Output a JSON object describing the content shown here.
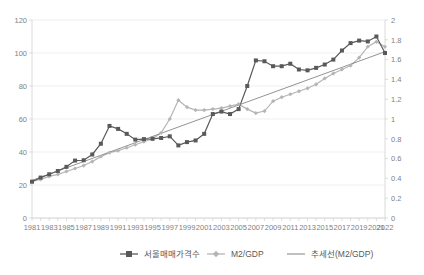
{
  "chart_data": {
    "type": "line",
    "title": "",
    "xlabel": "",
    "ylabel": "",
    "grid": true,
    "legend_position": "bottom",
    "x": [
      1981,
      1982,
      1983,
      1984,
      1985,
      1986,
      1987,
      1988,
      1989,
      1990,
      1991,
      1992,
      1993,
      1994,
      1995,
      1996,
      1997,
      1998,
      1999,
      2000,
      2001,
      2002,
      2003,
      2004,
      2005,
      2006,
      2007,
      2008,
      2009,
      2010,
      2011,
      2012,
      2013,
      2014,
      2015,
      2016,
      2017,
      2018,
      2019,
      2020,
      2021,
      2022
    ],
    "xtick_labels": [
      "1981",
      "1983",
      "1985",
      "1987",
      "1989",
      "1991",
      "1993",
      "1995",
      "1997",
      "1999",
      "2001",
      "2003",
      "2005",
      "2007",
      "2009",
      "2011",
      "2013",
      "2015",
      "2017",
      "2019",
      "2021",
      "2022"
    ],
    "axes": {
      "left": {
        "min": 0,
        "max": 120,
        "step": 20,
        "ticks": [
          "0",
          "20",
          "40",
          "60",
          "80",
          "100",
          "120"
        ]
      },
      "right": {
        "min": 0,
        "max": 2,
        "step": 0.2,
        "ticks": [
          "0",
          "0.2",
          "0.4",
          "0.6",
          "0.8",
          "1",
          "1.2",
          "1.4",
          "1.6",
          "1.8",
          "2"
        ]
      }
    },
    "series": [
      {
        "name": "서울매매가격수",
        "axis": "left",
        "color": "#595959",
        "marker": "square",
        "values": [
          22.0,
          24.5,
          26.5,
          28.5,
          31.0,
          34.8,
          35.0,
          38.5,
          45.0,
          55.8,
          54.0,
          51.0,
          47.5,
          47.8,
          48.0,
          48.5,
          49.5,
          44.0,
          46.0,
          47.0,
          51.0,
          63.0,
          64.5,
          63.0,
          66.0,
          80.0,
          95.5,
          95.0,
          92.0,
          92.0,
          93.5,
          90.0,
          89.5,
          91.0,
          93.0,
          96.0,
          101.5,
          106.0,
          107.5,
          107.0,
          110.0,
          100.0
        ]
      },
      {
        "name": "M2/GDP",
        "axis": "right",
        "color": "#b5b5b5",
        "marker": "diamond",
        "values": [
          0.37,
          0.39,
          0.42,
          0.44,
          0.47,
          0.5,
          0.53,
          0.57,
          0.62,
          0.66,
          0.68,
          0.71,
          0.74,
          0.77,
          0.8,
          0.86,
          1.0,
          1.19,
          1.12,
          1.09,
          1.09,
          1.1,
          1.11,
          1.13,
          1.15,
          1.1,
          1.06,
          1.08,
          1.18,
          1.22,
          1.25,
          1.28,
          1.31,
          1.35,
          1.41,
          1.46,
          1.5,
          1.54,
          1.62,
          1.73,
          1.78,
          1.73
        ]
      },
      {
        "name": "추세선(M2/GDP)",
        "axis": "right",
        "color": "#808080",
        "marker": "none",
        "trendline": true,
        "start_value": 0.38,
        "end_value": 1.68
      }
    ],
    "legend": [
      {
        "label": "서울매매가격수",
        "color": "#595959",
        "marker": "square"
      },
      {
        "label": "M2/GDP",
        "color": "#b5b5b5",
        "marker": "diamond"
      },
      {
        "label": "추세선(M2/GDP)",
        "color": "#808080",
        "marker": "line"
      }
    ]
  }
}
